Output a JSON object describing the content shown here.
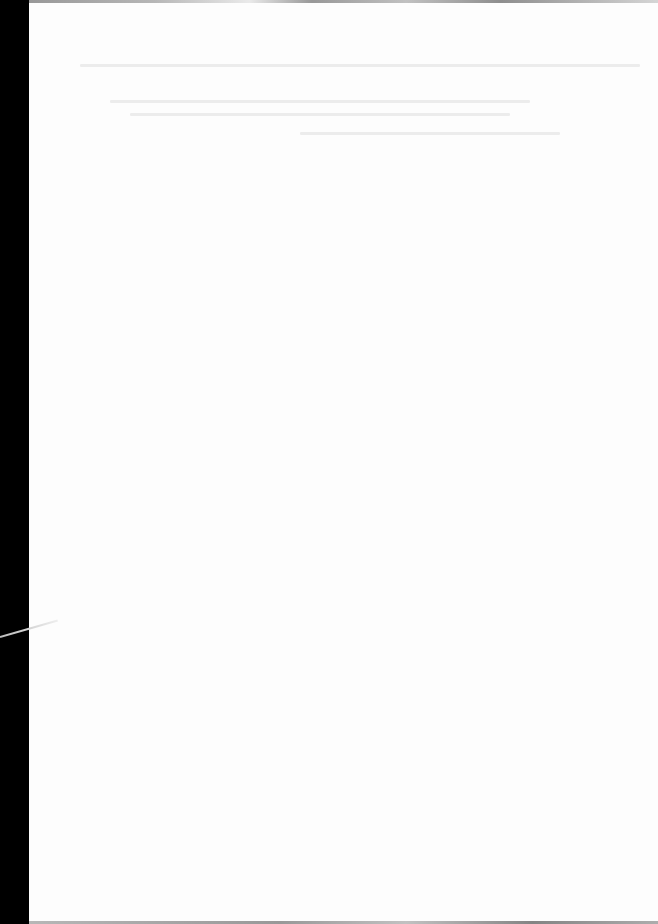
{
  "document": {
    "type": "blank scanned page",
    "background": "#fdfdfd",
    "margin_color": "#000000",
    "bleed_lines": [
      {
        "x": 80,
        "y": 64,
        "w": 560
      },
      {
        "x": 110,
        "y": 100,
        "w": 420
      },
      {
        "x": 130,
        "y": 113,
        "w": 380
      },
      {
        "x": 300,
        "y": 132,
        "w": 260
      }
    ]
  }
}
